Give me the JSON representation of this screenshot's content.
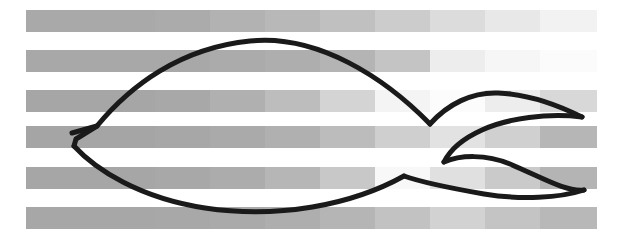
{
  "figure": {
    "canvas": {
      "width": 628,
      "height": 251,
      "background_color": "#ffffff"
    },
    "background": {
      "type": "horizontal-stripes",
      "description": "Six horizontal gray bands of varying tone, each band subdivided into lighter and darker rectangular blocks",
      "stripe_left_x": 26,
      "stripe_right_x": 597,
      "stripe_height": 22,
      "stripe_period": 40,
      "stripe_rows_y": [
        10,
        50,
        90,
        126,
        167,
        207
      ],
      "block_x_edges": [
        26,
        155,
        210,
        265,
        320,
        375,
        430,
        485,
        540,
        597
      ],
      "stripe_blocks": [
        [
          "#a9a9a9",
          "#ababab",
          "#b2b2b2",
          "#b8b8b8",
          "#c0c0c0",
          "#cccccc",
          "#dcdcdc",
          "#e8e8e8",
          "#f2f2f2"
        ],
        [
          "#a8a8a8",
          "#a8a8a8",
          "#ababab",
          "#aeaeae",
          "#b4b4b4",
          "#c4c4c4",
          "#ededed",
          "#f6f6f6",
          "#fbfbfb"
        ],
        [
          "#a6a6a6",
          "#a8a8a8",
          "#b0b0b0",
          "#bdbdbd",
          "#d4d4d4",
          "#f4f4f4",
          "#fcfcfc",
          "#ededed",
          "#d8d8d8"
        ],
        [
          "#a5a5a5",
          "#a7a7a7",
          "#aaaaaa",
          "#b0b0b0",
          "#bcbcbc",
          "#cfcfcf",
          "#e2e2e2",
          "#d0d0d0",
          "#b6b6b6"
        ],
        [
          "#a6a6a6",
          "#a8a8a8",
          "#acacac",
          "#b6b6b6",
          "#c8c8c8",
          "#f8f8f8",
          "#e0e0e0",
          "#cacaca",
          "#b4b4b4"
        ],
        [
          "#a7a7a7",
          "#a8a8a8",
          "#aaaaaa",
          "#aeaeae",
          "#b5b5b5",
          "#c2c2c2",
          "#d2d2d2",
          "#c4c4c4",
          "#b8b8b8"
        ]
      ]
    },
    "shape": {
      "name": "bird-outline",
      "stroke_color": "#1a1a1a",
      "fill": "none",
      "stroke_width": 5,
      "strokes": [
        {
          "name": "upper-body-outline",
          "path": "M 72 133 L 97 126 C 130 86 180 48 250 41 C 318 34 385 78 430 124"
        },
        {
          "name": "lower-body-outline",
          "path": "M 74 146 C 96 170 140 198 205 208 C 278 219 352 205 404 176"
        },
        {
          "name": "left-tail-notch",
          "path": "M 97 126 L 76 139 L 74 146"
        },
        {
          "name": "upper-wing-top-edge",
          "path": "M 430 124 C 448 104 472 92 498 93 C 528 94 560 106 582 117"
        },
        {
          "name": "upper-wing-bottom-edge",
          "path": "M 582 117 C 548 113 508 118 482 130 C 462 139 450 150 444 162"
        },
        {
          "name": "lower-wing-top-edge",
          "path": "M 444 162 C 460 155 486 154 510 164 C 543 178 566 192 584 190"
        },
        {
          "name": "lower-wing-bottom-edge",
          "path": "M 584 190 C 560 198 520 200 484 194 C 444 187 418 181 404 176"
        }
      ]
    }
  }
}
